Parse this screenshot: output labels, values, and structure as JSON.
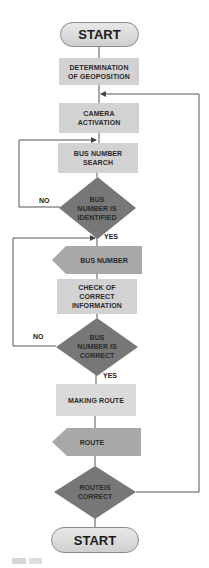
{
  "flowchart": {
    "start_top": {
      "label": "START"
    },
    "determination": {
      "label": "DETERMINATION OF GEOPOSITION"
    },
    "camera": {
      "label": "CAMERA ACTIVATION"
    },
    "bus_search": {
      "label": "BUS NUMBER SEARCH"
    },
    "decision_identified": {
      "label": "BUS NUMBER IS IDENTIFIED",
      "no": "NO",
      "yes": "YES"
    },
    "bus_number_display": {
      "label": "BUS NUMBER"
    },
    "check": {
      "label": "CHECK OF CORRECT INFORMATION"
    },
    "decision_correct": {
      "label": "BUS NUMBER IS CORRECT",
      "no": "NO",
      "yes": "YES"
    },
    "making_route": {
      "label": "MAKING ROUTE"
    },
    "route_display": {
      "label": "ROUTE"
    },
    "decision_route": {
      "label": "ROUTEIS CORRECT"
    },
    "start_bottom": {
      "label": "START"
    }
  },
  "colors": {
    "process_fill": "#d2d2d2",
    "decision_fill": "#777777",
    "display_fill": "#a8a8a8",
    "terminator_fill": "#dcdcdc",
    "line": "#555555"
  }
}
